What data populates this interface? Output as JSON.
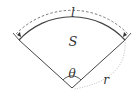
{
  "diagram": {
    "labels": {
      "arc_length": "l",
      "area": "S",
      "angle": "θ",
      "radius": "r"
    },
    "colors": {
      "stroke": "#444444",
      "dashed": "#666666",
      "dotted": "#999999"
    }
  }
}
